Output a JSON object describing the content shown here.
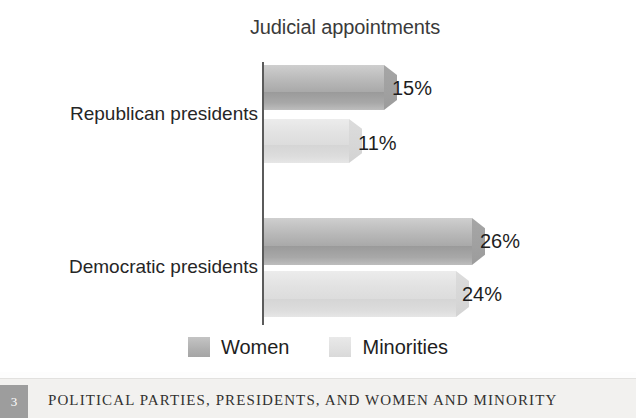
{
  "chart_data": {
    "type": "bar",
    "orientation": "horizontal",
    "title": "Judicial appointments",
    "xlabel": "",
    "ylabel": "",
    "categories": [
      "Republican presidents",
      "Democratic presidents"
    ],
    "series": [
      {
        "name": "Women",
        "values": [
          15,
          11
        ]
      },
      {
        "name": "Minorities",
        "values": [
          11,
          24
        ]
      }
    ],
    "data_labels": {
      "republican": {
        "women": "15%",
        "minorities": "11%"
      },
      "democratic": {
        "women": "26%",
        "minorities": "24%"
      }
    },
    "points": [
      {
        "category": "Republican presidents",
        "series": "Women",
        "value": 15,
        "label": "15%"
      },
      {
        "category": "Republican presidents",
        "series": "Minorities",
        "value": 11,
        "label": "11%"
      },
      {
        "category": "Democratic presidents",
        "series": "Women",
        "value": 26,
        "label": "26%"
      },
      {
        "category": "Democratic presidents",
        "series": "Minorities",
        "value": 24,
        "label": "24%"
      }
    ],
    "xlim": [
      0,
      30
    ],
    "grid": false,
    "legend_position": "bottom",
    "legend": [
      "Women",
      "Minorities"
    ],
    "colors": {
      "women": "#b0b0b0",
      "minorities": "#e0e0e0",
      "axis": "#5b5b5b",
      "text": "#1e1e1e"
    }
  },
  "chart": {
    "title": "Judicial appointments",
    "categories": {
      "republican": "Republican presidents",
      "democratic": "Democratic presidents"
    },
    "values": {
      "rep_women": "15%",
      "rep_minorities": "11%",
      "dem_women": "26%",
      "dem_minorities": "24%"
    },
    "legend": {
      "women": "Women",
      "minorities": "Minorities"
    }
  },
  "footer": {
    "page_number": "3",
    "running_head": "POLITICAL PARTIES, PRESIDENTS, AND WOMEN AND MINORITY"
  }
}
